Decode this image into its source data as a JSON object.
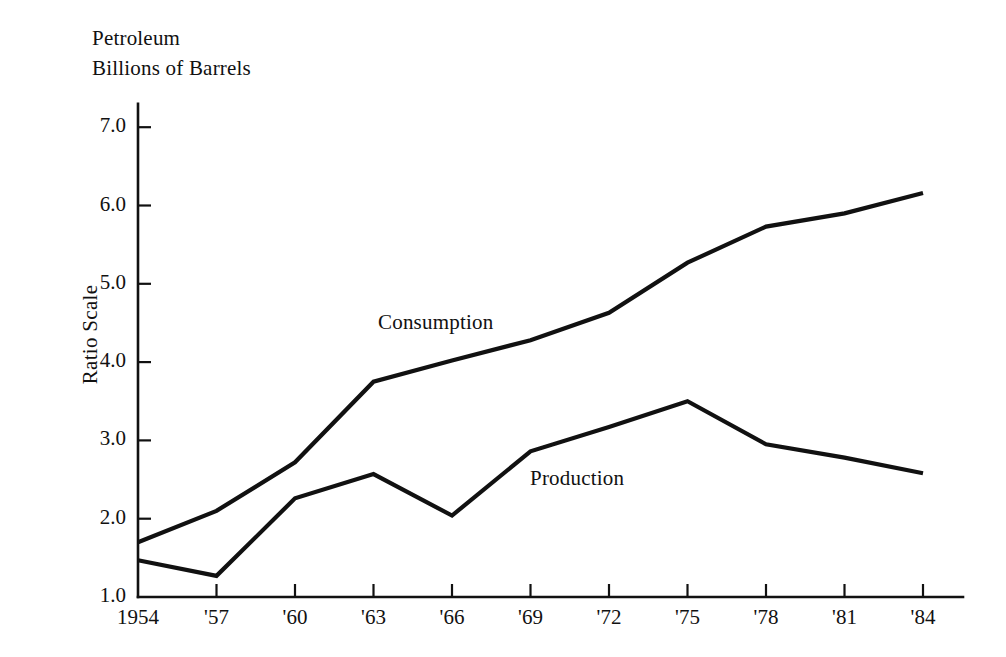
{
  "figure": {
    "title_lines": [
      "Petroleum",
      "Billions of Barrels"
    ],
    "y_axis_title": "Ratio Scale",
    "series_labels": {
      "consumption": "Consumption",
      "production": "Production"
    },
    "ink_color": "#111111",
    "background_color": "#ffffff"
  },
  "chart_data": {
    "type": "line",
    "title": "Petroleum Billions of Barrels",
    "xlabel": "",
    "ylabel": "Ratio Scale",
    "x": [
      "1954",
      "'57",
      "'60",
      "'63",
      "'66",
      "'69",
      "'72",
      "'75",
      "'78",
      "'81",
      "'84"
    ],
    "xtick_labels": [
      "1954",
      "'57",
      "'60",
      "'63",
      "'66",
      "'69",
      "'72",
      "'75",
      "'78",
      "'81",
      "'84"
    ],
    "ytick_labels": [
      "7.0",
      "6.0",
      "5.0",
      "4.0",
      "3.0",
      "2.0",
      "1.0"
    ],
    "ytick_values": [
      7.0,
      6.0,
      5.0,
      4.0,
      3.0,
      2.0,
      1.0
    ],
    "ylim": [
      1.0,
      7.3
    ],
    "xlim": [
      "1954",
      "'84"
    ],
    "grid": false,
    "legend": "inline-labels",
    "series": [
      {
        "name": "Consumption",
        "values": [
          1.7,
          2.1,
          2.72,
          3.75,
          4.02,
          4.28,
          4.63,
          5.27,
          5.73,
          5.9,
          6.16
        ],
        "label_position": {
          "x": 378,
          "y": 310
        }
      },
      {
        "name": "Production",
        "values": [
          1.47,
          1.27,
          2.26,
          2.57,
          2.04,
          2.86,
          3.17,
          3.5,
          2.95,
          2.78,
          2.58
        ],
        "label_position": {
          "x": 530,
          "y": 466
        }
      }
    ]
  },
  "axes_geometry": {
    "x_start_px": 138,
    "x_end_px": 963,
    "x_step_px": 78.5,
    "y_baseline_px": 597,
    "y_px_per_unit": 78.3
  }
}
